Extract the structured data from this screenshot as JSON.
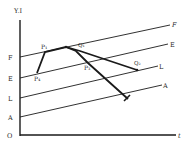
{
  "axes": {
    "y_label": "Y.I",
    "x_label": "t",
    "origin_label": "O"
  },
  "lines": [
    {
      "id": "F",
      "left_label": "F",
      "right_label": "F",
      "x1": 20,
      "y1": 57,
      "x2": 170,
      "y2": 25
    },
    {
      "id": "E",
      "left_label": "E",
      "right_label": "E",
      "x1": 20,
      "y1": 78,
      "x2": 168,
      "y2": 44
    },
    {
      "id": "L",
      "left_label": "L",
      "right_label": "L",
      "x1": 20,
      "y1": 98,
      "x2": 158,
      "y2": 66
    },
    {
      "id": "A",
      "left_label": "A",
      "right_label": "A",
      "x1": 20,
      "y1": 117,
      "x2": 162,
      "y2": 85
    }
  ],
  "points": {
    "P4": {
      "label": "P₄",
      "x": 37,
      "y": 73
    },
    "P1": {
      "label": "P₁",
      "x": 45,
      "y": 52
    },
    "Peak": {
      "label": "",
      "x": 66,
      "y": 47
    },
    "Q1": {
      "label": "Q₁",
      "x": 80,
      "y": 51
    },
    "P3": {
      "label": "P₃",
      "x": 88,
      "y": 63
    },
    "Q2": {
      "label": "Q₂",
      "x": 137,
      "y": 70
    },
    "End": {
      "label": "",
      "x": 128,
      "y": 99
    }
  },
  "colors": {
    "ink": "#1a1a1a",
    "background": "#ffffff"
  }
}
